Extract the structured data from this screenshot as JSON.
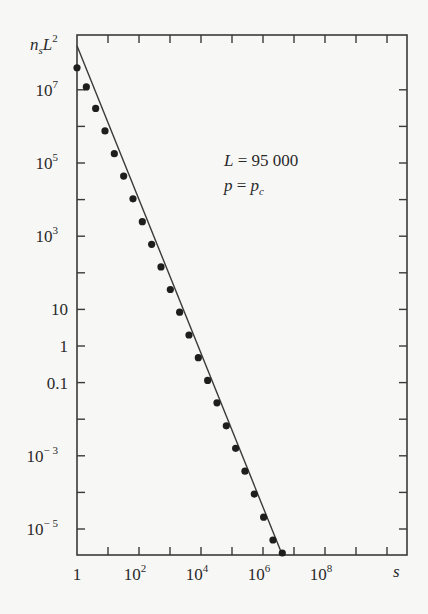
{
  "chart_data": {
    "type": "scatter",
    "title": "",
    "xlabel": "s",
    "ylabel": "n_s L^2",
    "xscale": "log",
    "yscale": "log",
    "xlim": [
      1,
      30000000000.0
    ],
    "ylim": [
      1e-06,
      200000000.0
    ],
    "x_ticks": [
      {
        "value": 1,
        "label": "1"
      },
      {
        "value": 100,
        "label": "10",
        "exp": "2"
      },
      {
        "value": 10000,
        "label": "10",
        "exp": "4"
      },
      {
        "value": 1000000,
        "label": "10",
        "exp": "6"
      },
      {
        "value": 100000000,
        "label": "10",
        "exp": "8"
      }
    ],
    "y_ticks": [
      {
        "value": 10000000.0,
        "label": "10",
        "exp": "7"
      },
      {
        "value": 100000.0,
        "label": "10",
        "exp": "5"
      },
      {
        "value": 1000.0,
        "label": "10",
        "exp": "3"
      },
      {
        "value": 10,
        "label": "10",
        "exp": ""
      },
      {
        "value": 1,
        "label": "1",
        "exp": ""
      },
      {
        "value": 0.1,
        "label": "0.1",
        "exp": ""
      },
      {
        "value": 0.001,
        "label": "10",
        "exp": "− 3"
      },
      {
        "value": 1e-05,
        "label": "10",
        "exp": "− 5"
      }
    ],
    "legend": null,
    "annotations": [
      "L = 95 000",
      "p = p_c"
    ],
    "series": [
      {
        "name": "simulation data",
        "marker": "filled-circle",
        "x": [
          1,
          2,
          4,
          8,
          16,
          32,
          64,
          128,
          256,
          512,
          1024,
          2048,
          4096,
          8192,
          16384,
          32768,
          65536,
          131072,
          262144,
          524288,
          1048576,
          2097152,
          4194304
        ],
        "y": [
          40000000.0,
          12000000.0,
          3100000.0,
          750000.0,
          180000.0,
          44000.0,
          10500.0,
          2500.0,
          600.0,
          145.0,
          35.0,
          8.4,
          2.0,
          0.48,
          0.115,
          0.028,
          0.0066,
          0.0016,
          0.00038,
          9e-05,
          2.1e-05,
          5e-06,
          1.2e-06
        ]
      },
      {
        "name": "power-law fit",
        "style": "line",
        "x": [
          1,
          4200000
        ],
        "y": [
          160000000.0,
          1e-06
        ]
      }
    ],
    "grid": false
  },
  "labels": {
    "y_axis_main": "n",
    "y_axis_sub": "s",
    "y_axis_L": "L",
    "y_axis_sup": "2",
    "x_axis": "s",
    "annotation_L": "L = 95 000",
    "annotation_p_main": "p = p",
    "annotation_p_sub": "c"
  }
}
